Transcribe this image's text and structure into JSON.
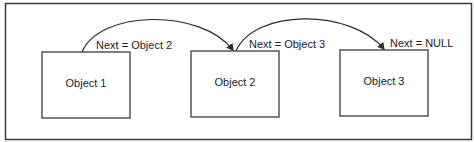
{
  "diagram": {
    "type": "linked-list",
    "nodes": [
      {
        "id": "object-1",
        "label": "Object 1",
        "pointer_label": "Next = Object 2",
        "next": "object-2"
      },
      {
        "id": "object-2",
        "label": "Object 2",
        "pointer_label": "Next = Object 3",
        "next": "object-3"
      },
      {
        "id": "object-3",
        "label": "Object 3",
        "pointer_label": "Next = NULL",
        "next": null
      }
    ],
    "colors": {
      "stroke": "#2a2a2a",
      "text": "#1a1a1a",
      "background": "#ffffff"
    }
  }
}
